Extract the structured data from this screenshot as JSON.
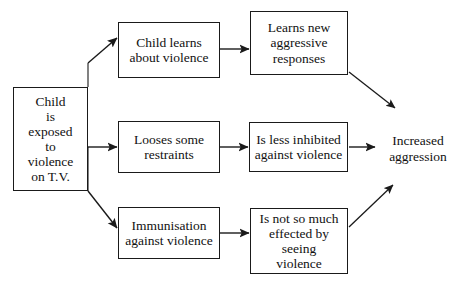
{
  "diagram": {
    "type": "flowchart",
    "orientation": "left-to-right",
    "line_color": "#1a1a1a",
    "background_color": "#ffffff",
    "text_color": "#111111",
    "nodes": [
      {
        "id": "source",
        "label": "Child\nis\nexposed\nto\nviolence\non T.V.",
        "shape": "rectangle",
        "column": 1
      },
      {
        "id": "learns",
        "label": "Child learns\nabout violence",
        "shape": "rectangle",
        "column": 2
      },
      {
        "id": "restraints",
        "label": "Looses some\nrestraints",
        "shape": "rectangle",
        "column": 2
      },
      {
        "id": "immunisation",
        "label": "Immunisation\nagainst violence",
        "shape": "rectangle",
        "column": 2
      },
      {
        "id": "responses",
        "label": "Learns new\naggressive\nresponses",
        "shape": "rectangle",
        "column": 3
      },
      {
        "id": "inhibited",
        "label": "Is less inhibited\nagainst violence",
        "shape": "rectangle",
        "column": 3
      },
      {
        "id": "effected",
        "label": "Is not so much\neffected by\nseeing\nviolence",
        "shape": "rectangle",
        "column": 3
      },
      {
        "id": "outcome",
        "label": "Increased\naggression",
        "shape": "none",
        "column": 4
      }
    ],
    "edges": [
      {
        "id": "edge-source-learns",
        "from": "source",
        "to": "learns",
        "style": "diagonal-up",
        "arrowhead": true
      },
      {
        "id": "edge-source-restraints",
        "from": "source",
        "to": "restraints",
        "style": "horizontal",
        "arrowhead": true
      },
      {
        "id": "edge-source-immunisation",
        "from": "source",
        "to": "immunisation",
        "style": "diagonal-down",
        "arrowhead": true
      },
      {
        "id": "edge-learns-responses",
        "from": "learns",
        "to": "responses",
        "style": "horizontal",
        "arrowhead": true
      },
      {
        "id": "edge-restraints-inhibited",
        "from": "restraints",
        "to": "inhibited",
        "style": "horizontal",
        "arrowhead": true
      },
      {
        "id": "edge-immunisation-effected",
        "from": "immunisation",
        "to": "effected",
        "style": "horizontal",
        "arrowhead": true
      },
      {
        "id": "edge-responses-outcome",
        "from": "responses",
        "to": "outcome",
        "style": "diagonal-down",
        "arrowhead": true
      },
      {
        "id": "edge-inhibited-outcome",
        "from": "inhibited",
        "to": "outcome",
        "style": "horizontal",
        "arrowhead": true
      },
      {
        "id": "edge-effected-outcome",
        "from": "effected",
        "to": "outcome",
        "style": "diagonal-up",
        "arrowhead": true
      }
    ]
  }
}
